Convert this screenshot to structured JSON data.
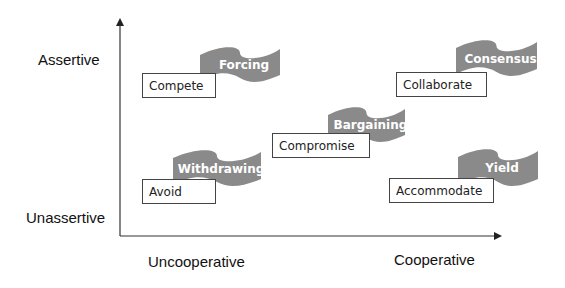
{
  "axes": {
    "y_top_label": "Assertive",
    "y_bottom_label": "Unassertive",
    "x_left_label": "Uncooperative",
    "x_right_label": "Cooperative"
  },
  "colors": {
    "flag_fill": "#8a8a8a",
    "box_border": "#444444",
    "axis": "#333333"
  },
  "styles": [
    {
      "key": "compete",
      "box_label": "Compete",
      "flag_label": "Forcing"
    },
    {
      "key": "collaborate",
      "box_label": "Collaborate",
      "flag_label": "Consensus"
    },
    {
      "key": "compromise",
      "box_label": "Compromise",
      "flag_label": "Bargaining"
    },
    {
      "key": "avoid",
      "box_label": "Avoid",
      "flag_label": "Withdrawing"
    },
    {
      "key": "accommodate",
      "box_label": "Accommodate",
      "flag_label": "Yield"
    }
  ]
}
